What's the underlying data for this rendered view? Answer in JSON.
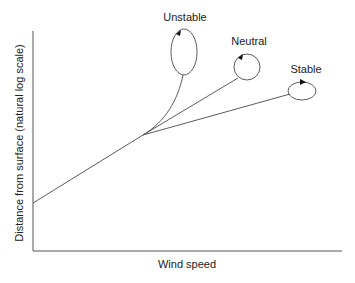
{
  "diagram": {
    "title": "",
    "x_axis_label": "Wind speed",
    "y_axis_label": "Distance from surface (natural log scale)",
    "profiles": [
      {
        "id": "unstable",
        "label": "Unstable",
        "eddy_shape": "tall-ellipse"
      },
      {
        "id": "neutral",
        "label": "Neutral",
        "eddy_shape": "circle"
      },
      {
        "id": "stable",
        "label": "Stable",
        "eddy_shape": "flat-ellipse"
      }
    ],
    "colors": {
      "line": "#4a4a4a",
      "axis": "#555555",
      "text": "#222222",
      "background": "#ffffff"
    }
  }
}
